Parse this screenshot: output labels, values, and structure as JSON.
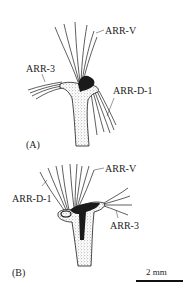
{
  "panel_a": {
    "panel_label": "(A)",
    "labels": {
      "arr_v": "ARR-V",
      "arr_3": "ARR-3",
      "arr_d1": "ARR-D-1"
    }
  },
  "panel_b": {
    "panel_label": "(B)",
    "labels": {
      "arr_v": "ARR-V",
      "arr_d1": "ARR-D-1",
      "arr_3": "ARR-3"
    }
  },
  "scale_bar": {
    "label": "2 mm"
  },
  "colors": {
    "ink": "#1a1a1a",
    "background": "#ffffff"
  }
}
